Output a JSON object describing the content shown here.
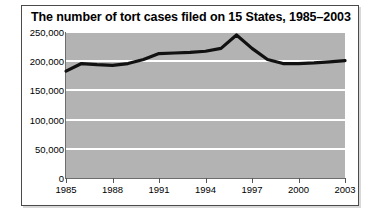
{
  "figure": {
    "title": "The number of tort cases filed on 15 States, 1985–2003",
    "border_color": "#4a4a4a",
    "plot_background_color": "#b3b3b3",
    "gridline_color": "#ffffff",
    "line_color": "#111111"
  },
  "chart_data": {
    "type": "line",
    "title": "The number of tort cases filed on 15 States, 1985–2003",
    "xlabel": "",
    "ylabel": "",
    "grid": true,
    "legend": "none",
    "xlim": [
      1985,
      2003
    ],
    "ylim": [
      0,
      250000
    ],
    "ytick_labels": [
      "0",
      "50,000",
      "100,000",
      "150,000",
      "200,000",
      "250,000"
    ],
    "ytick_values": [
      0,
      50000,
      100000,
      150000,
      200000,
      250000
    ],
    "xtick_labels": [
      "1985",
      "1988",
      "1991",
      "1994",
      "1997",
      "2000",
      "2003"
    ],
    "xtick_values": [
      1985,
      1988,
      1991,
      1994,
      1997,
      2000,
      2003
    ],
    "x": [
      1985,
      1986,
      1987,
      1988,
      1989,
      1990,
      1991,
      1992,
      1993,
      1994,
      1995,
      1996,
      1997,
      1998,
      1999,
      2000,
      2001,
      2002,
      2003
    ],
    "values": [
      183000,
      196000,
      194000,
      193000,
      196000,
      203000,
      213000,
      214000,
      215000,
      217000,
      222000,
      245000,
      222000,
      203000,
      196000,
      196000,
      197000,
      199000,
      201000
    ],
    "series": [
      {
        "name": "Tort cases filed",
        "values": [
          183000,
          196000,
          194000,
          193000,
          196000,
          203000,
          213000,
          214000,
          215000,
          217000,
          222000,
          245000,
          222000,
          203000,
          196000,
          196000,
          197000,
          199000,
          201000
        ]
      }
    ]
  }
}
